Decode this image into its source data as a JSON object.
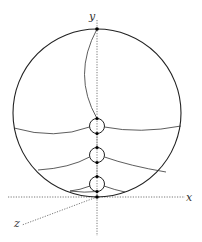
{
  "diagram": {
    "type": "geometric-construction",
    "axes": {
      "x_label": "x",
      "y_label": "y",
      "z_label": "z",
      "style": "dotted"
    },
    "outer_circle": {
      "cx": 97,
      "cy": 113,
      "r": 84
    },
    "small_circles": [
      {
        "cx": 97,
        "cy": 126,
        "r": 7.5
      },
      {
        "cx": 97,
        "cy": 155,
        "r": 7.5
      },
      {
        "cx": 97,
        "cy": 184,
        "r": 7.5
      }
    ],
    "points": [
      {
        "x": 97,
        "y": 29
      },
      {
        "x": 97,
        "y": 118.5
      },
      {
        "x": 97,
        "y": 133.5
      },
      {
        "x": 97,
        "y": 147.5
      },
      {
        "x": 97,
        "y": 162.5
      },
      {
        "x": 97,
        "y": 176.5
      },
      {
        "x": 97,
        "y": 191.5
      },
      {
        "x": 97,
        "y": 197
      }
    ],
    "colors": {
      "stroke": "#222222",
      "axis": "#555555",
      "background": "#ffffff"
    }
  }
}
